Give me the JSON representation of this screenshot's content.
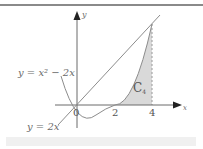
{
  "diagram": {
    "title": "",
    "axes": {
      "x_label": "x",
      "y_label": "y",
      "origin_label": "0"
    },
    "ticks": [
      {
        "label": "2",
        "x": 2
      },
      {
        "label": "4",
        "x": 4
      }
    ],
    "curves": [
      {
        "id": "parabola",
        "label": "y = x² − 2x",
        "equation": "y = x^2 - 2x"
      },
      {
        "id": "line",
        "label": "y = 2x",
        "equation": "y = 2x"
      }
    ],
    "region": {
      "label": "C",
      "subscript": "4",
      "from_x": 2,
      "to_x": 4,
      "fill": "#d9d9d9"
    },
    "colors": {
      "axis": "#6a6a6a",
      "curve": "#8c8c8c",
      "shade": "#d9d9d9",
      "dash": "#9a9a9a"
    }
  }
}
